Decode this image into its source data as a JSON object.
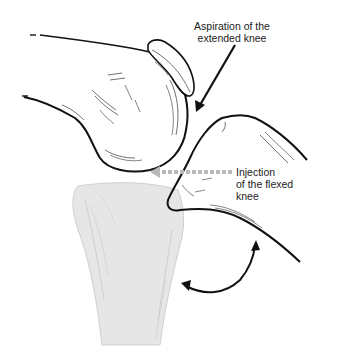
{
  "diagram": {
    "labels": {
      "aspiration": {
        "line1": "Aspiration of the",
        "line2": "extended knee"
      },
      "injection": {
        "line1": "Injection",
        "line2": "of the flexed",
        "line3": "knee"
      }
    },
    "colors": {
      "outline": "#111111",
      "tibia_fill": "#e6e6e6",
      "dotted_arrow": "#b8b8b8",
      "background": "#ffffff"
    },
    "icons": {
      "aspiration_arrow": "solid-arrow-down-left",
      "injection_arrow": "dotted-arrow-left",
      "flexion_arrow": "curved-double-arrow"
    }
  }
}
